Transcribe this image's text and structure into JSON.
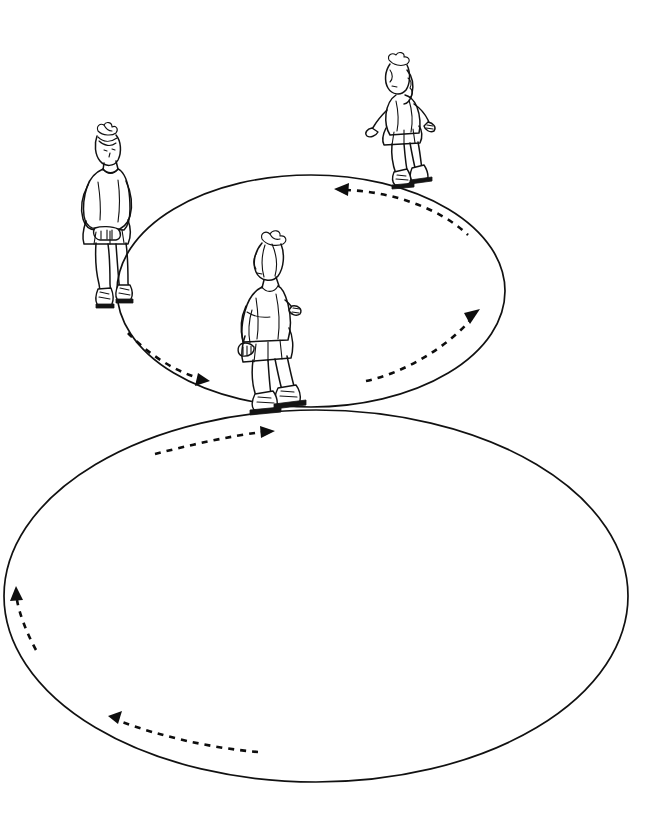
{
  "image": {
    "kind": "line-drawing",
    "subject": "figure-skating-circles-diagram",
    "background_color": "#ffffff",
    "ink_color": "#111111",
    "width": 669,
    "height": 830,
    "text_labels": []
  },
  "diagram": {
    "ellipses": [
      {
        "name": "upper-circle",
        "cx": 311,
        "cy": 291,
        "rx": 194,
        "ry": 116,
        "stroke": "#111111",
        "fill": "none"
      },
      {
        "name": "lower-circle",
        "cx": 316,
        "cy": 596,
        "rx": 312,
        "ry": 186,
        "stroke": "#111111",
        "fill": "none"
      }
    ],
    "tangent_point": {
      "x": 290,
      "y": 408
    },
    "arrows": [
      {
        "name": "upper-circle-top-arrow",
        "circle": "upper-circle",
        "direction": "left",
        "rotation": "counterclockwise",
        "style": "dashed",
        "head_at": {
          "x": 337,
          "y": 188
        }
      },
      {
        "name": "upper-circle-right-arrow",
        "circle": "upper-circle",
        "direction": "up-right",
        "rotation": "counterclockwise",
        "style": "dashed",
        "head_at": {
          "x": 478,
          "y": 313
        }
      },
      {
        "name": "upper-circle-bottom-left-arrow",
        "circle": "upper-circle",
        "direction": "down-right",
        "rotation": "counterclockwise",
        "style": "dashed",
        "head_at": {
          "x": 208,
          "y": 379
        }
      },
      {
        "name": "lower-circle-top-arrow",
        "circle": "lower-circle",
        "direction": "right",
        "rotation": "clockwise",
        "style": "dashed",
        "head_at": {
          "x": 272,
          "y": 432
        }
      },
      {
        "name": "lower-circle-left-arrow",
        "circle": "lower-circle",
        "direction": "up",
        "rotation": "clockwise",
        "style": "dashed",
        "head_at": {
          "x": 17,
          "y": 592
        }
      },
      {
        "name": "lower-circle-bottom-arrow",
        "circle": "lower-circle",
        "direction": "up-left",
        "rotation": "clockwise",
        "style": "dashed",
        "head_at": {
          "x": 111,
          "y": 718
        }
      }
    ],
    "figures": [
      {
        "name": "skater-left-standing",
        "pose": "standing-upright-arms-clasped-front",
        "facing": "toward-viewer",
        "position": {
          "x": 80,
          "y": 128,
          "width": 65,
          "height": 175
        }
      },
      {
        "name": "skater-top-right-gliding",
        "pose": "gliding-arms-extended",
        "facing": "left-profile",
        "position": {
          "x": 368,
          "y": 52,
          "width": 70,
          "height": 140
        }
      },
      {
        "name": "skater-center-gliding",
        "pose": "gliding-knees-bent-profile",
        "facing": "left-profile",
        "position": {
          "x": 236,
          "y": 228,
          "width": 75,
          "height": 185
        }
      }
    ]
  }
}
